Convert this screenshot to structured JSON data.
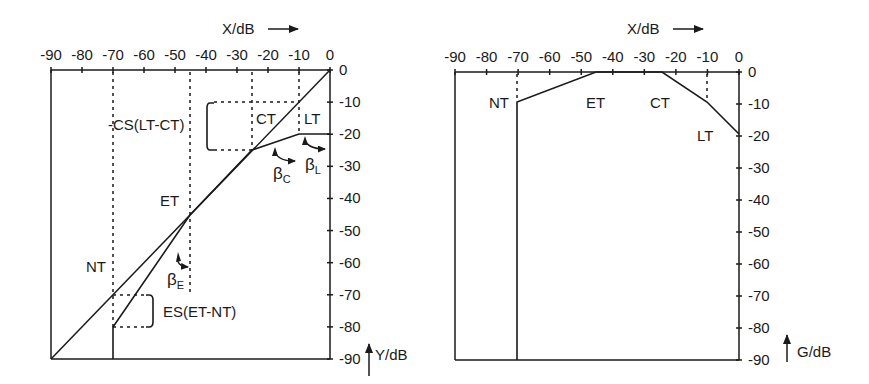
{
  "chart_data": [
    {
      "id": "left",
      "type": "line",
      "title": "",
      "xlabel": "X/dB",
      "ylabel": "Y/dB",
      "xlim": [
        -90,
        0
      ],
      "ylim": [
        -90,
        0
      ],
      "x_ticks": [
        -90,
        -80,
        -70,
        -60,
        -50,
        -40,
        -30,
        -20,
        -10,
        0
      ],
      "y_ticks": [
        0,
        -10,
        -20,
        -30,
        -40,
        -50,
        -60,
        -70,
        -80,
        -90
      ],
      "x_tick_labels": [
        "-90",
        "-80",
        "-70",
        "-60",
        "-50",
        "-40",
        "-30",
        "-20",
        "-10",
        "0"
      ],
      "y_tick_labels": [
        "0",
        "-10",
        "-20",
        "-30",
        "-40",
        "-50",
        "-60",
        "-70",
        "-80",
        "-90"
      ],
      "grid": false,
      "series": [
        {
          "name": "identity (Y = X)",
          "style": "solid",
          "points": [
            [
              -90,
              -90
            ],
            [
              0,
              0
            ]
          ]
        },
        {
          "name": "characteristic",
          "style": "solid",
          "points": [
            [
              -70,
              -90
            ],
            [
              -70,
              -80
            ],
            [
              -45,
              -45
            ],
            [
              -25,
              -25
            ],
            [
              -10,
              -20
            ],
            [
              0,
              -20
            ]
          ]
        }
      ],
      "thresholds": [
        {
          "label": "NT",
          "x": -70,
          "dotted_from_y": 0,
          "dotted_to_y": -80
        },
        {
          "label": "ET",
          "x": -45,
          "dotted_from_y": 0,
          "dotted_to_y": -70
        },
        {
          "label": "CT",
          "x": -25,
          "dotted_from_y": 0,
          "dotted_to_y": -25
        },
        {
          "label": "LT",
          "x": -10,
          "dotted_from_y": 0,
          "dotted_to_y": -20
        }
      ],
      "annotations": [
        {
          "text": "-CS(LT-CT)",
          "bracket_y": [
            -10,
            -25
          ],
          "bracket_x": -38
        },
        {
          "text": "ES(ET-NT)",
          "bracket_y": [
            -70,
            -80
          ],
          "bracket_x": -57
        },
        {
          "text": "βE",
          "symbol": "β",
          "sub": "E",
          "meaning": "expansion slope angle"
        },
        {
          "text": "βC",
          "symbol": "β",
          "sub": "C",
          "meaning": "compression slope angle"
        },
        {
          "text": "βL",
          "symbol": "β",
          "sub": "L",
          "meaning": "limiter slope angle"
        }
      ]
    },
    {
      "id": "right",
      "type": "line",
      "title": "",
      "xlabel": "X/dB",
      "ylabel": "G/dB",
      "xlim": [
        -90,
        0
      ],
      "ylim": [
        -90,
        0
      ],
      "x_ticks": [
        -90,
        -80,
        -70,
        -60,
        -50,
        -40,
        -30,
        -20,
        -10,
        0
      ],
      "y_ticks": [
        0,
        -10,
        -20,
        -30,
        -40,
        -50,
        -60,
        -70,
        -80,
        -90
      ],
      "x_tick_labels": [
        "-90",
        "-80",
        "-70",
        "-60",
        "-50",
        "-40",
        "-30",
        "-20",
        "-10",
        "0"
      ],
      "y_tick_labels": [
        "0",
        "-10",
        "-20",
        "-30",
        "-40",
        "-50",
        "-60",
        "-70",
        "-80",
        "-90"
      ],
      "grid": false,
      "series": [
        {
          "name": "gain",
          "style": "solid",
          "points": [
            [
              -70,
              -90
            ],
            [
              -70,
              -10
            ],
            [
              -45,
              0
            ],
            [
              -25,
              0
            ],
            [
              -10,
              -10
            ],
            [
              0,
              -20
            ]
          ]
        }
      ],
      "thresholds": [
        {
          "label": "NT",
          "x": -70,
          "dotted_from_y": 0,
          "dotted_to_y": -10
        },
        {
          "label": "ET",
          "x": -45
        },
        {
          "label": "CT",
          "x": -25
        },
        {
          "label": "LT",
          "x": -10,
          "dotted_from_y": 0,
          "dotted_to_y": -10
        }
      ]
    }
  ],
  "labels": {
    "left": {
      "x_axis_title": "X/dB",
      "y_axis_title": "Y/dB",
      "nt": "NT",
      "et": "ET",
      "ct": "CT",
      "lt": "LT",
      "cs": "-CS(LT-CT)",
      "es": "ES(ET-NT)",
      "beta": "β",
      "beta_e_sub": "E",
      "beta_c_sub": "C",
      "beta_l_sub": "L"
    },
    "right": {
      "x_axis_title": "X/dB",
      "y_axis_title": "G/dB",
      "nt": "NT",
      "et": "ET",
      "ct": "CT",
      "lt": "LT"
    }
  },
  "colors": {
    "line": "#1a1a1a",
    "background": "#ffffff"
  }
}
